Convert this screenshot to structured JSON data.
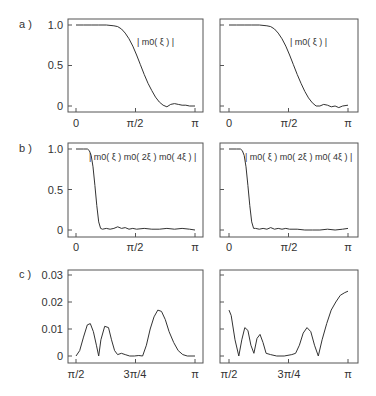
{
  "chart_data": [
    {
      "type": "line",
      "panel": "a-left",
      "row_label": "a )",
      "annotation": "| m0( ξ ) |",
      "x_ticks": [
        "0",
        "π/2",
        "π"
      ],
      "y_ticks": [
        "0",
        "0.5",
        "1.0"
      ],
      "xlim": [
        0,
        3.1416
      ],
      "ylim": [
        0,
        1.0
      ],
      "x": [
        0,
        0.2,
        0.4,
        0.6,
        0.8,
        1.0,
        1.1,
        1.2,
        1.3,
        1.4,
        1.5,
        1.6,
        1.7,
        1.8,
        1.9,
        2.0,
        2.1,
        2.2,
        2.3,
        2.4,
        2.5,
        2.6,
        2.7,
        2.8,
        2.9,
        3.0,
        3.1416
      ],
      "y": [
        1.0,
        1.0,
        1.0,
        1.0,
        1.0,
        0.99,
        0.98,
        0.95,
        0.9,
        0.83,
        0.74,
        0.63,
        0.51,
        0.39,
        0.28,
        0.19,
        0.11,
        0.05,
        0.01,
        -0.01,
        0.02,
        0.03,
        0.02,
        0.01,
        0.01,
        0.0,
        0.0
      ]
    },
    {
      "type": "line",
      "panel": "a-right",
      "annotation": "| m0( ξ ) |",
      "x_ticks": [
        "0",
        "π/2",
        "π"
      ],
      "xlim": [
        0,
        3.1416
      ],
      "ylim": [
        0,
        1.0
      ],
      "x": [
        0,
        0.2,
        0.4,
        0.6,
        0.8,
        1.0,
        1.1,
        1.2,
        1.3,
        1.4,
        1.5,
        1.6,
        1.7,
        1.8,
        1.9,
        2.0,
        2.1,
        2.2,
        2.3,
        2.4,
        2.5,
        2.6,
        2.7,
        2.8,
        2.9,
        3.0,
        3.1416
      ],
      "y": [
        1.0,
        1.0,
        1.0,
        1.0,
        1.0,
        0.99,
        0.98,
        0.95,
        0.9,
        0.83,
        0.74,
        0.63,
        0.51,
        0.39,
        0.28,
        0.18,
        0.1,
        0.04,
        0.0,
        0.0,
        0.02,
        0.01,
        -0.01,
        0.0,
        -0.02,
        0.0,
        0.01
      ]
    },
    {
      "type": "line",
      "panel": "b-left",
      "row_label": "b )",
      "annotation": "| m0( ξ ) m0( 2ξ ) m0( 4ξ ) |",
      "x_ticks": [
        "0",
        "π/2",
        "π"
      ],
      "y_ticks": [
        "0",
        "0.5",
        "1.0"
      ],
      "xlim": [
        0,
        3.1416
      ],
      "ylim": [
        0,
        1.0
      ],
      "x": [
        0,
        0.2,
        0.3,
        0.35,
        0.4,
        0.45,
        0.5,
        0.55,
        0.6,
        0.65,
        0.7,
        0.8,
        0.9,
        1.0,
        1.1,
        1.2,
        1.3,
        1.4,
        1.5,
        1.6,
        1.8,
        2.0,
        2.2,
        2.4,
        2.6,
        2.8,
        3.0,
        3.1416
      ],
      "y": [
        1.0,
        1.0,
        1.0,
        0.98,
        0.92,
        0.78,
        0.55,
        0.3,
        0.1,
        0.02,
        0.01,
        0.02,
        0.01,
        0.02,
        0.04,
        0.02,
        0.03,
        0.01,
        0.02,
        0.01,
        0.02,
        0.01,
        0.01,
        0.02,
        0.01,
        0.02,
        0.01,
        0.0
      ]
    },
    {
      "type": "line",
      "panel": "b-right",
      "annotation": "| m0( ξ ) m0( 2ξ ) m0( 4ξ ) |",
      "x_ticks": [
        "0",
        "π/2",
        "π"
      ],
      "xlim": [
        0,
        3.1416
      ],
      "ylim": [
        0,
        1.0
      ],
      "x": [
        0,
        0.2,
        0.3,
        0.35,
        0.4,
        0.45,
        0.5,
        0.55,
        0.6,
        0.65,
        0.7,
        0.8,
        0.9,
        1.0,
        1.1,
        1.2,
        1.3,
        1.4,
        1.5,
        1.6,
        1.8,
        2.0,
        2.2,
        2.4,
        2.6,
        2.8,
        3.0,
        3.1416
      ],
      "y": [
        1.0,
        1.0,
        1.0,
        0.98,
        0.92,
        0.78,
        0.55,
        0.3,
        0.1,
        0.02,
        0.02,
        0.01,
        0.02,
        0.01,
        0.03,
        0.01,
        0.02,
        0.01,
        0.02,
        0.01,
        0.01,
        0.0,
        0.0,
        0.0,
        0.01,
        0.0,
        0.01,
        0.02
      ]
    },
    {
      "type": "line",
      "panel": "c-left",
      "row_label": "c )",
      "x_ticks": [
        "π/2",
        "3π/4",
        "π"
      ],
      "y_ticks": [
        "0",
        "0.01",
        "0.02",
        "0.03"
      ],
      "xlim": [
        1.5708,
        3.1416
      ],
      "ylim": [
        0,
        0.03
      ],
      "x": [
        1.5708,
        1.62,
        1.67,
        1.72,
        1.76,
        1.8,
        1.84,
        1.87,
        1.9,
        1.95,
        2.0,
        2.04,
        2.08,
        2.12,
        2.17,
        2.22,
        2.28,
        2.34,
        2.4,
        2.45,
        2.5,
        2.55,
        2.6,
        2.65,
        2.7,
        2.75,
        2.8,
        2.86,
        2.92,
        2.98,
        3.04,
        3.1416
      ],
      "y": [
        0.0,
        0.002,
        0.007,
        0.0115,
        0.012,
        0.009,
        0.004,
        0.0,
        0.006,
        0.011,
        0.0105,
        0.006,
        0.002,
        0.0005,
        0.001,
        0.0005,
        0.0,
        0.0,
        0.0002,
        0.0,
        0.004,
        0.01,
        0.0145,
        0.017,
        0.0165,
        0.0135,
        0.009,
        0.005,
        0.002,
        0.0005,
        0.0,
        0.0
      ]
    },
    {
      "type": "line",
      "panel": "c-right",
      "x_ticks": [
        "π/2",
        "3π/4",
        "π"
      ],
      "xlim": [
        1.5708,
        3.1416
      ],
      "ylim": [
        0,
        0.03
      ],
      "x": [
        1.5708,
        1.6,
        1.65,
        1.7,
        1.74,
        1.78,
        1.82,
        1.86,
        1.9,
        1.94,
        1.98,
        2.02,
        2.06,
        2.12,
        2.2,
        2.3,
        2.4,
        2.45,
        2.5,
        2.55,
        2.6,
        2.65,
        2.7,
        2.75,
        2.8,
        2.86,
        2.92,
        2.98,
        3.04,
        3.1,
        3.1416
      ],
      "y": [
        0.017,
        0.015,
        0.006,
        0.0,
        0.006,
        0.0105,
        0.0095,
        0.004,
        0.001,
        0.0065,
        0.008,
        0.005,
        0.001,
        0.0005,
        0.0,
        0.0,
        0.0005,
        0.001,
        0.004,
        0.0085,
        0.0105,
        0.009,
        0.004,
        0.0,
        0.006,
        0.012,
        0.017,
        0.02,
        0.0225,
        0.0235,
        0.024
      ]
    }
  ],
  "rows": {
    "a": {
      "label": "a )",
      "annotation": "| m0( ξ ) |"
    },
    "b": {
      "label": "b )",
      "annotation": "| m0( ξ ) m0( 2ξ ) m0( 4ξ ) |"
    },
    "c": {
      "label": "c )"
    }
  },
  "axes": {
    "ab_x_ticks": [
      "0",
      "π/2",
      "π"
    ],
    "ab_y_ticks": [
      "1.0",
      "0.5",
      "0"
    ],
    "c_x_ticks": [
      "π/2",
      "3π/4",
      "π"
    ],
    "c_y_ticks": [
      "0.03",
      "0.02",
      "0.01",
      "0"
    ]
  }
}
